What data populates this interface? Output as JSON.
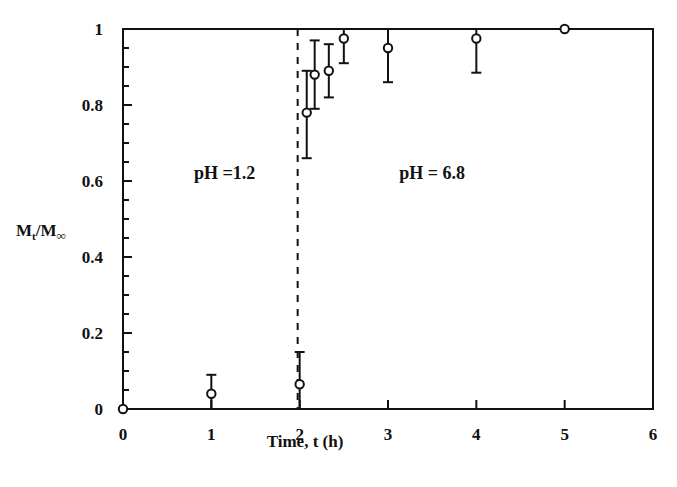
{
  "chart_data": {
    "type": "scatter",
    "title": "",
    "xlabel": "Time, t (h)",
    "ylabel": "Mt/M∞",
    "ylabel_parts": {
      "main": "M",
      "sub1": "t",
      "slash": "/M",
      "sub2": "∞"
    },
    "xlim": [
      0,
      6
    ],
    "ylim": [
      0,
      1
    ],
    "xticks": [
      0,
      1,
      2,
      3,
      4,
      5,
      6
    ],
    "xtick_labels": [
      "0",
      "1",
      "2",
      "3",
      "4",
      "5",
      "6"
    ],
    "yticks": [
      0,
      0.2,
      0.4,
      0.6,
      0.8,
      1
    ],
    "ytick_labels": [
      "0",
      "0.2",
      "0.4",
      "0.6",
      "0.8",
      "1"
    ],
    "y_minor_step": 0.05,
    "grid": false,
    "legend": null,
    "marker": "open-circle",
    "series": [
      {
        "name": "release",
        "x": [
          0,
          1,
          2,
          2.08,
          2.17,
          2.33,
          2.5,
          3,
          4,
          5
        ],
        "y": [
          0.0,
          0.04,
          0.065,
          0.78,
          0.88,
          0.89,
          0.975,
          0.95,
          0.975,
          1.0
        ],
        "err_low": [
          null,
          0.0,
          0.0,
          0.66,
          0.79,
          0.82,
          0.91,
          0.86,
          0.885,
          null
        ],
        "err_high": [
          null,
          0.09,
          0.15,
          0.89,
          0.97,
          0.96,
          1.0,
          1.0,
          1.0,
          null
        ]
      }
    ],
    "vline": {
      "x": 2,
      "style": "dashed"
    },
    "annotations": [
      {
        "text": "pH =1.2",
        "x": 1.15,
        "y": 0.62
      },
      {
        "text": "pH = 6.8",
        "x": 3.5,
        "y": 0.62
      }
    ]
  },
  "colors": {
    "ink": "#111111",
    "background": "#ffffff"
  }
}
